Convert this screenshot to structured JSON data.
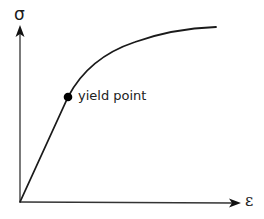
{
  "diagram": {
    "y_axis": {
      "symbol": "σ",
      "meaning": "stress"
    },
    "x_axis": {
      "symbol": "ε",
      "meaning": "strain"
    },
    "annotations": [
      {
        "id": "yield-point",
        "label": "yield point"
      }
    ],
    "regions": [
      {
        "name": "elastic (linear) region",
        "from": "origin",
        "to": "yield point"
      },
      {
        "name": "plastic region",
        "from": "yield point",
        "to": "end of curve"
      }
    ],
    "colors": {
      "stroke": "#1a1a1a",
      "axis": "#333333",
      "background": "#ffffff"
    }
  }
}
